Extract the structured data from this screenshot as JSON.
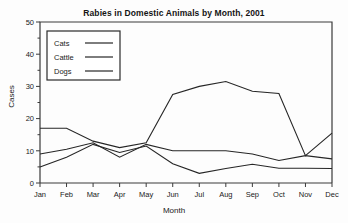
{
  "chart_data": {
    "type": "line",
    "title": "Rabies in Domestic Animals by Month, 2001",
    "xlabel": "Month",
    "ylabel": "Cases",
    "categories": [
      "Jan",
      "Feb",
      "Mar",
      "Apr",
      "May",
      "Jun",
      "Jul",
      "Aug",
      "Sep",
      "Oct",
      "Nov",
      "Dec"
    ],
    "ylim": [
      0,
      50
    ],
    "yticks": [
      0,
      10,
      20,
      30,
      40,
      50
    ],
    "grid": false,
    "legend_position": "upper-left-inset",
    "series": [
      {
        "name": "Cats",
        "values": [
          9,
          10.5,
          12.5,
          8,
          12,
          10,
          10,
          10,
          9,
          7,
          8.5,
          7.5
        ]
      },
      {
        "name": "Cattle",
        "values": [
          17,
          17,
          13,
          11,
          12.5,
          27.5,
          30,
          31.5,
          28.5,
          27.8,
          8.5,
          15.5
        ]
      },
      {
        "name": "Dogs",
        "values": [
          5,
          8,
          12,
          9.5,
          11.5,
          6,
          3,
          4.5,
          5.8,
          4.6,
          4.6,
          4.5
        ]
      }
    ]
  },
  "legend": {
    "items": [
      {
        "label": "Cats"
      },
      {
        "label": "Cattle"
      },
      {
        "label": "Dogs"
      }
    ]
  },
  "colors": {
    "line": "#262626",
    "frame": "#3a3a3a",
    "text": "#1a1a1a",
    "background": "#fdfdfd"
  }
}
